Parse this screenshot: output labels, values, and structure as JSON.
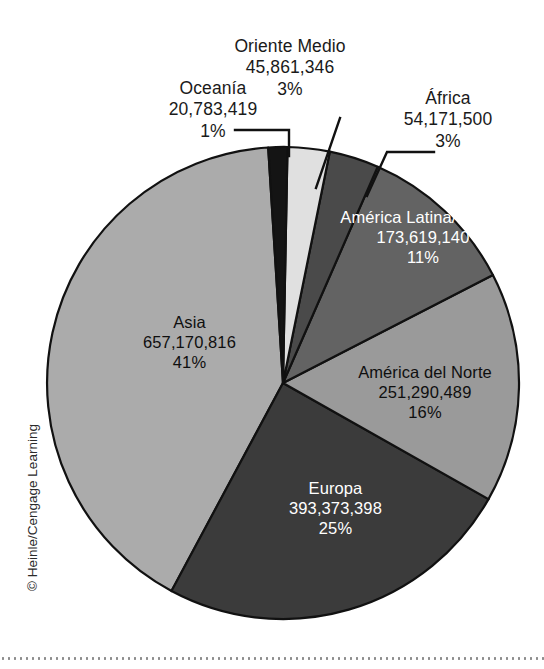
{
  "figure": {
    "credit": "© Heinle/Cengage Learning"
  },
  "chart_data": {
    "type": "pie",
    "title": "",
    "subtitle": "",
    "xlabel": "",
    "ylabel": "",
    "legend_position": "none",
    "grid": false,
    "total": 1596270108,
    "value_format": "comma-separated integers",
    "categories": [
      "Asia",
      "Europa",
      "América del Norte",
      "América Latina/Caribe",
      "África",
      "Oriente Medio",
      "Oceanía"
    ],
    "values": [
      657170816,
      393373398,
      251290489,
      173619140,
      54171500,
      45861346,
      20783419
    ],
    "percent_labels": [
      "41%",
      "25%",
      "16%",
      "11%",
      "3%",
      "3%",
      "1%"
    ],
    "value_labels": [
      "657,170,816",
      "393,373,398",
      "251,290,489",
      "173,619,140",
      "54,171,500",
      "45,861,346",
      "20,783,419"
    ],
    "slices": [
      {
        "name": "Asia",
        "value": 657170816,
        "value_label": "657,170,816",
        "percent": 41,
        "percent_label": "41%",
        "color": "#ababab",
        "label_placement": "inside"
      },
      {
        "name": "Europa",
        "value": 393373398,
        "value_label": "393,373,398",
        "percent": 25,
        "percent_label": "25%",
        "color": "#3b3b3b",
        "label_placement": "inside"
      },
      {
        "name": "América del Norte",
        "value": 251290489,
        "value_label": "251,290,489",
        "percent": 16,
        "percent_label": "16%",
        "color": "#9a9a9a",
        "label_placement": "inside"
      },
      {
        "name": "América Latina/Caribe",
        "value": 173619140,
        "value_label": "173,619,140",
        "percent": 11,
        "percent_label": "11%",
        "color": "#636363",
        "label_placement": "inside"
      },
      {
        "name": "África",
        "value": 54171500,
        "value_label": "54,171,500",
        "percent": 3,
        "percent_label": "3%",
        "color": "#4a4a4a",
        "label_placement": "outside-leader"
      },
      {
        "name": "Oriente Medio",
        "value": 45861346,
        "value_label": "45,861,346",
        "percent": 3,
        "percent_label": "3%",
        "color": "#e0e0e0",
        "label_placement": "outside-leader"
      },
      {
        "name": "Oceanía",
        "value": 20783419,
        "value_label": "20,783,419",
        "percent": 1,
        "percent_label": "1%",
        "color": "#141414",
        "label_placement": "outside-leader"
      }
    ]
  }
}
